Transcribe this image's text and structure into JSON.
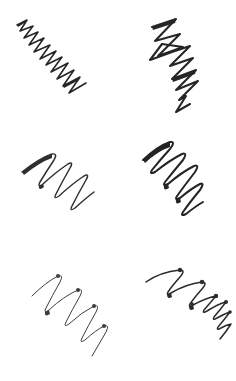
{
  "image": {
    "kind": "handwriting-stroke-sample-sheet",
    "description": "Six handwritten zigzag pen-stroke scribbles arranged in a 2-column by 3-row grid on a plain white sheet",
    "width": 236,
    "height": 381,
    "background_color": "#ffffff",
    "ink_color": "#262626",
    "ink_color_light": "#3d3d3d",
    "grid": {
      "columns": 2,
      "rows": 3,
      "panel_width": 118,
      "panel_height": 127
    }
  },
  "panels": [
    {
      "id": "panel-1",
      "position": "top-left",
      "label": "tight narrow zigzag",
      "column": 1,
      "row": 1,
      "origin_x": 0,
      "origin_y": 0,
      "stroke_width": 1.6,
      "ink": "#262626",
      "peak_count": 6,
      "amplitude": "small",
      "frequency": "high",
      "has_nib_dots": false,
      "direction": "upper-left to lower-right",
      "path": "M17,25 L27,20 L20,31 L33,26 L24,38 L38,32 L29,45 L44,38 L34,52 L50,45 L40,59 L56,51 L46,65 L62,57 L51,72 L68,63 L57,79 L74,70 L63,86 L80,77 L69,93 L86,83",
      "taper_paths": [
        "M17,25 L27,20 L26,22 L18,27 Z",
        "M63,86 L80,77 L79,80 L64,88 Z"
      ]
    },
    {
      "id": "panel-2",
      "position": "top-right",
      "label": "bold Z-loop zigzag",
      "column": 2,
      "row": 1,
      "origin_x": 118,
      "origin_y": 0,
      "stroke_width": 2.1,
      "ink": "#262626",
      "peak_count": 4,
      "amplitude": "large",
      "frequency": "medium",
      "has_nib_dots": false,
      "direction": "upper-left to lower-right",
      "path": "M152,27 L176,19 L155,41 L180,34 L158,56 L183,47 L162,44 L150,60 L172,52 L190,46 L170,66 L193,58 L172,79 L196,70 L176,90 L198,81 L179,100 L186,96 L176,112 L190,104",
      "taper_paths": [
        "M152,27 L176,19 L175,23 L153,30 Z",
        "M172,79 L196,70 L195,74 L173,82 Z"
      ]
    },
    {
      "id": "panel-3",
      "position": "middle-left",
      "label": "wide smooth V strokes",
      "column": 1,
      "row": 2,
      "origin_x": 0,
      "origin_y": 127,
      "stroke_width": 1.5,
      "ink": "#2f2f2f",
      "peak_count": 3,
      "amplitude": "large",
      "frequency": "low",
      "has_nib_dots": false,
      "direction": "upper-left to lower-right",
      "path": "M22,172 Q40,158 52,154 Q58,153 54,160 Q46,172 40,182 Q37,188 43,184 Q56,172 68,164 Q74,161 70,168 Q62,182 56,194 Q53,200 59,196 Q72,184 84,176 Q90,173 86,180 Q78,194 72,206 Q69,212 75,208 Q86,198 94,192",
      "taper_paths": [
        "M22,172 Q40,158 52,154 L52,158 Q40,162 24,175 Z",
        "M40,182 Q37,188 43,184 L44,187 Q38,192 39,185 Z"
      ]
    },
    {
      "id": "panel-4",
      "position": "middle-right",
      "label": "dense bold flame zigzag",
      "column": 2,
      "row": 2,
      "origin_x": 118,
      "origin_y": 127,
      "stroke_width": 2.0,
      "ink": "#242424",
      "peak_count": 5,
      "amplitude": "large",
      "frequency": "high",
      "has_nib_dots": false,
      "direction": "upper-left to lower-right",
      "path": "M143,160 Q158,146 170,142 Q176,141 170,149 Q160,160 152,170 Q149,175 155,172 Q170,160 182,154 Q188,152 183,160 Q173,172 165,182 Q162,187 168,184 Q182,172 194,166 Q200,164 195,172 Q185,185 177,196 Q174,201 180,198 Q192,188 200,184 Q205,182 200,190 Q190,202 183,212 Q180,217 186,214 Q196,206 203,202",
      "taper_paths": [
        "M143,160 Q158,146 170,142 L170,147 Q158,151 145,163 Z",
        "M165,182 Q162,187 168,184 L169,188 Q163,192 164,185 Z",
        "M177,196 Q174,201 180,198 L181,202 Q175,206 176,199 Z"
      ]
    },
    {
      "id": "panel-5",
      "position": "bottom-left",
      "label": "thin looping zigzag with nib dots",
      "column": 1,
      "row": 3,
      "origin_x": 0,
      "origin_y": 254,
      "stroke_width": 1.0,
      "ink": "#3d3d3d",
      "peak_count": 4,
      "amplitude": "large",
      "frequency": "low",
      "has_nib_dots": true,
      "direction": "upper-left to lower-right",
      "path": "M32,296 Q46,282 58,276 Q64,274 60,282 Q52,296 46,308 Q43,314 49,310 Q64,296 78,290 Q84,288 80,296 Q72,310 66,322 Q63,328 69,324 Q82,312 94,306 Q100,304 96,312 Q88,326 82,338 Q79,344 85,340 Q96,330 104,326 Q110,324 106,332 Q98,346 92,356",
      "nib_dots": [
        {
          "cx": 58,
          "cy": 276,
          "r": 2.0
        },
        {
          "cx": 78,
          "cy": 290,
          "r": 2.0
        },
        {
          "cx": 94,
          "cy": 306,
          "r": 2.0
        },
        {
          "cx": 104,
          "cy": 326,
          "r": 2.0
        }
      ],
      "taper_paths": [
        "M46,308 Q43,314 49,310 L50,314 Q44,318 45,311 Z"
      ]
    },
    {
      "id": "panel-6",
      "position": "bottom-right",
      "label": "dense flat zigzag with nib dots",
      "column": 2,
      "row": 3,
      "origin_x": 118,
      "origin_y": 254,
      "stroke_width": 1.5,
      "ink": "#2b2b2b",
      "peak_count": 6,
      "amplitude": "medium",
      "frequency": "high",
      "has_nib_dots": true,
      "direction": "upper-left to lower-right",
      "path": "M146,282 Q160,272 180,270 Q186,270 180,277 Q172,286 168,292 Q166,296 171,293 Q186,284 202,282 Q208,282 202,289 Q194,298 190,304 Q188,308 193,305 Q206,298 216,296 Q210,303 204,310 Q202,314 207,311 Q218,304 226,302 Q220,310 214,317 Q212,321 217,318 Q224,314 230,312 Q224,320 218,327 Q216,331 221,328 Q226,325 231,324 Q226,332 220,339",
      "nib_dots": [
        {
          "cx": 180,
          "cy": 270,
          "r": 2.2
        },
        {
          "cx": 202,
          "cy": 282,
          "r": 2.2
        },
        {
          "cx": 216,
          "cy": 296,
          "r": 2.2
        },
        {
          "cx": 226,
          "cy": 302,
          "r": 2.0
        },
        {
          "cx": 230,
          "cy": 312,
          "r": 1.8
        },
        {
          "cx": 192,
          "cy": 304,
          "r": 1.8
        }
      ],
      "taper_paths": [
        "M168,292 Q166,296 171,293 L172,297 Q167,300 167,294 Z",
        "M190,304 Q188,308 193,305 L194,309 Q189,312 189,306 Z"
      ]
    }
  ]
}
